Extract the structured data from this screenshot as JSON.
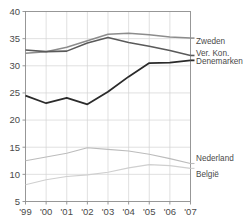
{
  "chart_data": {
    "type": "line",
    "title": "",
    "subtitle": "",
    "xlabel": "",
    "ylabel": "",
    "grid": true,
    "legend_position": "right-inline",
    "x": [
      "'99",
      "'00",
      "'01",
      "'02",
      "'03",
      "'04",
      "'05",
      "'06",
      "'07"
    ],
    "xlim": [
      1999,
      2007
    ],
    "ylim": [
      5,
      40
    ],
    "yticks": [
      5,
      10,
      15,
      20,
      25,
      30,
      35,
      40
    ],
    "xticks": [
      "'99",
      "'00",
      "'01",
      "'02",
      "'03",
      "'04",
      "'05",
      "'06",
      "'07"
    ],
    "series": [
      {
        "name": "Zweden",
        "color": "#8c8c8c",
        "width": 1.5,
        "values": [
          32.3,
          32.6,
          33.4,
          34.6,
          35.8,
          36.0,
          35.7,
          35.3,
          35.1
        ]
      },
      {
        "name": "Ver. Kon.",
        "color": "#5a5a5a",
        "width": 1.6,
        "values": [
          32.9,
          32.6,
          32.7,
          34.2,
          35.2,
          34.3,
          33.6,
          32.8,
          31.9
        ]
      },
      {
        "name": "Denemarken",
        "color": "#2b2b2b",
        "width": 1.8,
        "values": [
          24.5,
          23.1,
          24.1,
          22.9,
          25.2,
          28.0,
          30.5,
          30.6,
          31.0
        ]
      },
      {
        "name": "Nederland",
        "color": "#bcbcbc",
        "width": 1.1,
        "values": [
          12.5,
          13.2,
          13.9,
          14.9,
          14.6,
          14.3,
          13.7,
          12.9,
          12.0
        ]
      },
      {
        "name": "België",
        "color": "#cfcfcf",
        "width": 1.1,
        "values": [
          8.1,
          9.0,
          9.6,
          9.9,
          10.4,
          11.2,
          11.8,
          11.6,
          11.1
        ]
      }
    ],
    "legend_labels": [
      {
        "key": "zweden",
        "text": "Zweden"
      },
      {
        "key": "ver-kon",
        "text": "Ver. Kon."
      },
      {
        "key": "denemarken",
        "text": "Denemarken"
      },
      {
        "key": "nederland",
        "text": "Nederland"
      },
      {
        "key": "belgie",
        "text": "België"
      }
    ]
  },
  "axis": {
    "y_labels": [
      "40",
      "35",
      "30",
      "25",
      "20",
      "15",
      "10",
      "5"
    ],
    "x_labels": [
      "'99",
      "'00",
      "'01",
      "'02",
      "'03",
      "'04",
      "'05",
      "'06",
      "'07"
    ]
  },
  "legend": {
    "zweden": "Zweden",
    "ver_kon": "Ver. Kon.",
    "denemarken": "Denemarken",
    "nederland": "Nederland",
    "belgie": "België"
  }
}
